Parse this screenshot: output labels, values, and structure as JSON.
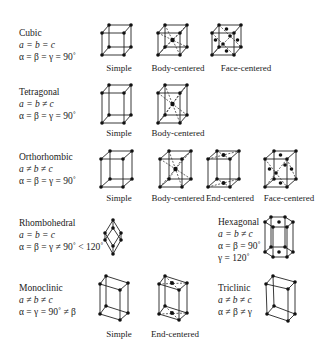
{
  "systems": [
    {
      "name": "Cubic",
      "lengths": "a = b = c",
      "angles": "α = β = γ = 90˚",
      "lattices": [
        "Simple",
        "Body-centered",
        "Face-centered"
      ]
    },
    {
      "name": "Tetragonal",
      "lengths": "a = b ≠ c",
      "angles": "α = β = γ = 90˚",
      "lattices": [
        "Simple",
        "Body-centered"
      ]
    },
    {
      "name": "Orthorhombic",
      "lengths": "a ≠ b ≠ c",
      "angles": "α = β = γ = 90˚",
      "lattices": [
        "Simple",
        "Body-centered",
        "End-centered",
        "Face-centered"
      ]
    },
    {
      "name": "Rhombohedral",
      "lengths": "a = b = c",
      "angles": "α = β = γ ≠ 90˚ < 120˚",
      "lattices": []
    },
    {
      "name": "Hexagonal",
      "lengths": "a = b ≠ c",
      "angles": "α = β = 90˚",
      "angles2": "γ = 120˚",
      "lattices": []
    },
    {
      "name": "Monoclinic",
      "lengths": "a ≠ b ≠ c",
      "angles": "α = γ = 90˚ ≠ β",
      "lattices": [
        "Simple",
        "End-centered"
      ]
    },
    {
      "name": "Triclinic",
      "lengths": "a ≠ b ≠ c",
      "angles": "α ≠ β ≠ γ",
      "lattices": []
    }
  ]
}
